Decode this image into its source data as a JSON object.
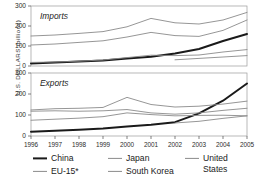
{
  "chart_data": {
    "type": "line",
    "title": "",
    "xlabel": "",
    "ylabel": "U.S. DOLLARS (billions)",
    "x": [
      1996,
      1997,
      1998,
      1999,
      2000,
      2001,
      2002,
      2003,
      2004,
      2005
    ],
    "xtick_labels": [
      "1996",
      "1997",
      "1998",
      "1999",
      "2000",
      "2001",
      "2002",
      "2003",
      "2004",
      "2005"
    ],
    "ytick_labels": [
      "0",
      "100",
      "200",
      "300"
    ],
    "ytick_values": [
      0,
      100,
      200,
      300
    ],
    "ylim": [
      0,
      300
    ],
    "grid": false,
    "legend_position": "bottom",
    "panels": [
      {
        "name": "imports",
        "label": "Imports",
        "series": [
          {
            "name": "China",
            "color": "#1a1a1a",
            "width": 2.0,
            "values": [
              13,
              17,
              22,
              28,
              38,
              46,
              62,
              85,
              125,
              160
            ]
          },
          {
            "name": "EU-15*",
            "color": "#8a8a8a",
            "width": 0.9,
            "values": [
              150,
              155,
              163,
              172,
              196,
              238,
              216,
              210,
              230,
              268
            ]
          },
          {
            "name": "Japan",
            "color": "#8a8a8a",
            "width": 0.9,
            "values": [
              105,
              110,
              118,
              126,
              145,
              168,
              152,
              148,
              178,
              230
            ]
          },
          {
            "name": "South Korea",
            "color": "#8a8a8a",
            "width": 0.9,
            "values": [
              18,
              20,
              24,
              30,
              42,
              54,
              52,
              55,
              70,
              82
            ]
          },
          {
            "name": "United States",
            "color": "#8a8a8a",
            "width": 0.9,
            "values": [
              null,
              null,
              null,
              null,
              null,
              null,
              31,
              38,
              45,
              52
            ]
          }
        ]
      },
      {
        "name": "exports",
        "label": "Exports",
        "series": [
          {
            "name": "China",
            "color": "#1a1a1a",
            "width": 2.0,
            "values": [
              20,
              25,
              30,
              36,
              45,
              54,
              66,
              108,
              168,
              250
            ]
          },
          {
            "name": "EU-15*",
            "color": "#8a8a8a",
            "width": 0.9,
            "values": [
              124,
              130,
              132,
              136,
              184,
              150,
              138,
              142,
              152,
              166
            ]
          },
          {
            "name": "Japan",
            "color": "#8a8a8a",
            "width": 0.9,
            "values": [
              118,
              120,
              118,
              120,
              126,
              110,
              104,
              110,
              122,
              132
            ]
          },
          {
            "name": "South Korea",
            "color": "#8a8a8a",
            "width": 0.9,
            "values": [
              75,
              80,
              85,
              92,
              110,
              102,
              96,
              98,
              99,
              96
            ]
          },
          {
            "name": "United States",
            "color": "#8a8a8a",
            "width": 0.9,
            "values": [
              null,
              null,
              null,
              null,
              null,
              null,
              62,
              70,
              84,
              96
            ]
          }
        ]
      }
    ],
    "legend": [
      {
        "name": "China",
        "color": "#1a1a1a",
        "width": 2.0
      },
      {
        "name": "EU-15*",
        "color": "#8a8a8a",
        "width": 1.0
      },
      {
        "name": "Japan",
        "color": "#8a8a8a",
        "width": 1.0
      },
      {
        "name": "South Korea",
        "color": "#8a8a8a",
        "width": 1.0
      },
      {
        "name": "United States",
        "color": "#8a8a8a",
        "width": 1.0
      }
    ],
    "legend_layout": {
      "united_states_line1": "United",
      "united_states_line2": "States"
    }
  }
}
